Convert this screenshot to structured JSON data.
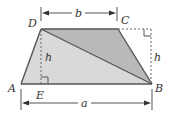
{
  "diagram": {
    "type": "trapezoid-area",
    "vertices": {
      "A": {
        "label": "A"
      },
      "B": {
        "label": "B"
      },
      "C": {
        "label": "C"
      },
      "D": {
        "label": "D"
      },
      "E": {
        "label": "E"
      }
    },
    "dimensions": {
      "top_base": "b",
      "bottom_base": "a",
      "height_left": "h",
      "height_right": "h"
    },
    "colors": {
      "upper_triangle_fill": "#b9b9b9",
      "lower_triangle_fill": "#d9d9d9",
      "edge": "#555555",
      "dashed": "#666666",
      "text": "#333333"
    }
  }
}
